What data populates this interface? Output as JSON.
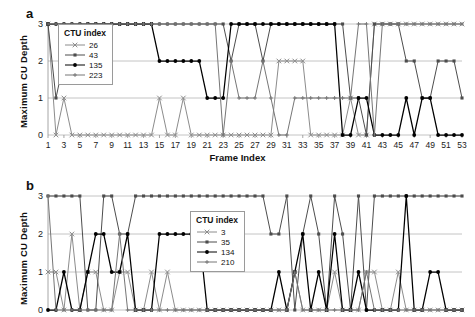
{
  "figure": {
    "panels": [
      {
        "id": "a",
        "label": "a",
        "legend_title": "CTU index",
        "x_label": "Frame Index"
      },
      {
        "id": "b",
        "label": "b",
        "legend_title": "CTU index",
        "x_label": ""
      }
    ]
  },
  "chart_data": [
    {
      "type": "line",
      "panel": "a",
      "title": "",
      "xlabel": "Frame Index",
      "ylabel": "Maximum CU Depth",
      "xlim": [
        1,
        53
      ],
      "ylim": [
        0,
        3
      ],
      "yticks": [
        0,
        1,
        2,
        3
      ],
      "xticks": [
        1,
        3,
        5,
        7,
        9,
        11,
        13,
        15,
        17,
        19,
        21,
        23,
        25,
        27,
        29,
        31,
        33,
        35,
        37,
        39,
        41,
        43,
        45,
        47,
        49,
        51,
        53
      ],
      "grid": "horizontal",
      "legend_title": "CTU index",
      "legend_position": "inside-upper-left",
      "x": [
        1,
        2,
        3,
        4,
        5,
        6,
        7,
        8,
        9,
        10,
        11,
        12,
        13,
        14,
        15,
        16,
        17,
        18,
        19,
        20,
        21,
        22,
        23,
        24,
        25,
        26,
        27,
        28,
        29,
        30,
        31,
        32,
        33,
        34,
        35,
        36,
        37,
        38,
        39,
        40,
        41,
        42,
        43,
        44,
        45,
        46,
        47,
        48,
        49,
        50,
        51,
        52,
        53
      ],
      "series": [
        {
          "name": "26",
          "marker": "x",
          "color": "#8c8c8c",
          "values": [
            3,
            0,
            1,
            0,
            0,
            0,
            0,
            0,
            0,
            0,
            0,
            0,
            0,
            0,
            1,
            0,
            0,
            1,
            0,
            0,
            0,
            0,
            0,
            0,
            0,
            0,
            0,
            0,
            0,
            2,
            2,
            2,
            2,
            0,
            0,
            0,
            0,
            0,
            1,
            0,
            0,
            3,
            3,
            3,
            3,
            3,
            3,
            3,
            3,
            3,
            3,
            3,
            3
          ]
        },
        {
          "name": "43",
          "marker": "square",
          "color": "#4d4d4d",
          "values": [
            3,
            1,
            2,
            2,
            2,
            3,
            3,
            3,
            3,
            3,
            3,
            3,
            3,
            3,
            3,
            3,
            3,
            3,
            3,
            3,
            3,
            3,
            3,
            2,
            3,
            3,
            3,
            2,
            3,
            3,
            3,
            3,
            3,
            3,
            3,
            3,
            3,
            3,
            1,
            1,
            0,
            3,
            3,
            3,
            3,
            2,
            2,
            1,
            1,
            2,
            2,
            2,
            1
          ]
        },
        {
          "name": "135",
          "marker": "circle",
          "color": "#000000",
          "values": [
            3,
            3,
            3,
            3,
            3,
            3,
            3,
            3,
            3,
            3,
            3,
            3,
            3,
            3,
            2,
            2,
            2,
            2,
            2,
            2,
            1,
            1,
            1,
            3,
            3,
            3,
            3,
            3,
            3,
            3,
            3,
            3,
            3,
            3,
            3,
            3,
            3,
            0,
            0,
            1,
            1,
            0,
            0,
            0,
            0,
            1,
            0,
            1,
            1,
            0,
            0,
            0,
            0
          ]
        },
        {
          "name": "223",
          "marker": "plus",
          "color": "#767676",
          "values": [
            3,
            3,
            3,
            3,
            3,
            3,
            3,
            3,
            3,
            3,
            3,
            3,
            3,
            3,
            3,
            3,
            3,
            3,
            3,
            3,
            3,
            3,
            0,
            2,
            1,
            1,
            1,
            2,
            1,
            0,
            0,
            1,
            1,
            1,
            1,
            1,
            1,
            1,
            1,
            3,
            3,
            0,
            3,
            3,
            3,
            3,
            3,
            3,
            3,
            3,
            3,
            3,
            3
          ]
        }
      ]
    },
    {
      "type": "line",
      "panel": "b",
      "title": "",
      "xlabel": "",
      "ylabel": "Maximum CU Depth",
      "xlim": [
        1,
        53
      ],
      "ylim": [
        0,
        3
      ],
      "yticks": [
        0,
        1,
        2,
        3
      ],
      "xticks": [],
      "grid": "horizontal",
      "legend_title": "CTU index",
      "legend_position": "inside-center",
      "x": [
        1,
        2,
        3,
        4,
        5,
        6,
        7,
        8,
        9,
        10,
        11,
        12,
        13,
        14,
        15,
        16,
        17,
        18,
        19,
        20,
        21,
        22,
        23,
        24,
        25,
        26,
        27,
        28,
        29,
        30,
        31,
        32,
        33,
        34,
        35,
        36,
        37,
        38,
        39,
        40,
        41,
        42,
        43,
        44,
        45,
        46,
        47,
        48,
        49,
        50,
        51,
        52,
        53
      ],
      "series": [
        {
          "name": "3",
          "marker": "x",
          "color": "#8c8c8c",
          "values": [
            1,
            1,
            0,
            2,
            0,
            1,
            1,
            0,
            0,
            1,
            1,
            0,
            0,
            1,
            0,
            1,
            0,
            0,
            0,
            0,
            0,
            0,
            0,
            0,
            0,
            0,
            0,
            0,
            0,
            0,
            0,
            1,
            0,
            0,
            0,
            0,
            1,
            0,
            0,
            0,
            1,
            1,
            0,
            0,
            1,
            0,
            0,
            0,
            0,
            0,
            0,
            0,
            0
          ]
        },
        {
          "name": "35",
          "marker": "square",
          "color": "#4d4d4d",
          "values": [
            3,
            3,
            3,
            3,
            3,
            0,
            0,
            3,
            3,
            2,
            2,
            3,
            3,
            3,
            3,
            3,
            3,
            3,
            3,
            3,
            3,
            3,
            3,
            3,
            3,
            3,
            3,
            3,
            2,
            2,
            3,
            0,
            2,
            3,
            2,
            0,
            3,
            2,
            0,
            3,
            0,
            3,
            3,
            3,
            3,
            3,
            3,
            3,
            3,
            3,
            3,
            3,
            3
          ]
        },
        {
          "name": "134",
          "marker": "circle",
          "color": "#000000",
          "values": [
            0,
            0,
            1,
            0,
            0,
            1,
            2,
            2,
            1,
            1,
            2,
            0,
            0,
            0,
            2,
            2,
            2,
            2,
            2,
            2,
            0,
            0,
            0,
            0,
            0,
            0,
            0,
            0,
            0,
            1,
            0,
            1,
            2,
            0,
            1,
            0,
            2,
            0,
            0,
            1,
            0,
            0,
            0,
            0,
            0,
            3,
            0,
            0,
            1,
            1,
            0,
            0,
            0
          ]
        },
        {
          "name": "210",
          "marker": "plus",
          "color": "#767676",
          "values": [
            3,
            0,
            0,
            0,
            0,
            0,
            0,
            0,
            0,
            2,
            0,
            0,
            0,
            0,
            0,
            0,
            0,
            0,
            0,
            0,
            0,
            0,
            0,
            0,
            0,
            0,
            0,
            0,
            0,
            0,
            0,
            1,
            0,
            0,
            0,
            0,
            0,
            0,
            0,
            0,
            1,
            0,
            0,
            0,
            0,
            0,
            0,
            0,
            0,
            0,
            0,
            0,
            0
          ]
        }
      ]
    }
  ]
}
